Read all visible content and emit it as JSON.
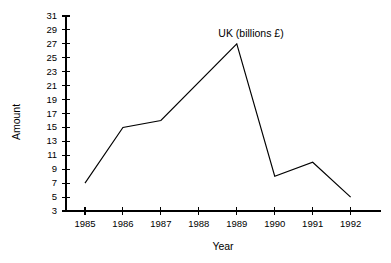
{
  "chart_data": {
    "type": "line",
    "title": "UK (billions £)",
    "xlabel": "Year",
    "ylabel": "Amount",
    "categories": [
      "1985",
      "1986",
      "1987",
      "1988",
      "1989",
      "1990",
      "1991",
      "1992"
    ],
    "x": [
      1985,
      1986,
      1987,
      1988,
      1989,
      1990,
      1991,
      1992
    ],
    "values": [
      7,
      15,
      16,
      21.5,
      27,
      8,
      10,
      5
    ],
    "vertices": [
      {
        "x": 1985,
        "y": 7
      },
      {
        "x": 1986,
        "y": 15
      },
      {
        "x": 1987,
        "y": 16
      },
      {
        "x": 1989,
        "y": 27
      },
      {
        "x": 1990,
        "y": 8
      },
      {
        "x": 1991,
        "y": 10
      },
      {
        "x": 1992,
        "y": 5
      }
    ],
    "xlim": [
      1984.5,
      1992.8
    ],
    "ylim": [
      3,
      31
    ],
    "ytick_labels": [
      "3",
      "5",
      "7",
      "9",
      "11",
      "13",
      "15",
      "17",
      "19",
      "21",
      "23",
      "25",
      "27",
      "29",
      "31"
    ],
    "yticks": [
      3,
      5,
      7,
      9,
      11,
      13,
      15,
      17,
      19,
      21,
      23,
      25,
      27,
      29,
      31
    ],
    "xtick_labels": [
      "1985",
      "1986",
      "1987",
      "1988",
      "1989",
      "1990",
      "1991",
      "1992"
    ],
    "grid": false,
    "legend": false,
    "legend_position": "none",
    "line_color": "#000000",
    "axis_color": "#000000",
    "background_color": "#ffffff",
    "title_position": "inside-top-center",
    "annotations": []
  }
}
